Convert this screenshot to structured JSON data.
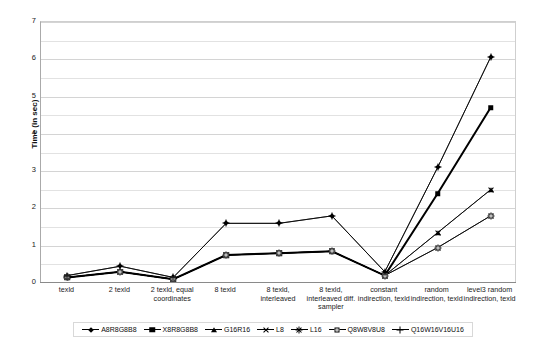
{
  "chart_data": {
    "type": "line",
    "title": "",
    "xlabel": "",
    "ylabel": "Time (in sec)",
    "ylim": [
      0,
      7
    ],
    "yticks": [
      0,
      1,
      2,
      3,
      4,
      5,
      6,
      7
    ],
    "ytick_labels": [
      "0",
      "1",
      "2",
      "3",
      "4",
      "5",
      "6",
      "7"
    ],
    "minor_gridlines": [
      0.5,
      1.5,
      2.5,
      3.5,
      4.5,
      5.5,
      6.5
    ],
    "grid": true,
    "legend_position": "bottom",
    "categories": [
      "texld",
      "2 texld",
      "2 texld, equal coordinates",
      "8 texld",
      "8 texld, interleaved",
      "8 texld, interleaved diff. sampler",
      "constant indirection, texld",
      "random indirection, texld",
      "level3 random indirection, texld"
    ],
    "series": [
      {
        "name": "A8R8G8B8",
        "marker": "diamond",
        "weight": "thin",
        "values": [
          0.2,
          0.45,
          0.15,
          1.6,
          1.6,
          1.8,
          0.3,
          3.1,
          6.05
        ]
      },
      {
        "name": "X8R8G8B8",
        "marker": "square",
        "weight": "thick",
        "values": [
          0.15,
          0.3,
          0.1,
          0.75,
          0.8,
          0.85,
          0.2,
          2.4,
          4.7
        ]
      },
      {
        "name": "G16R16",
        "marker": "triangle",
        "weight": "thin",
        "values": [
          0.15,
          0.3,
          0.1,
          0.75,
          0.8,
          0.85,
          0.2,
          1.35,
          2.5
        ]
      },
      {
        "name": "L8",
        "marker": "x",
        "weight": "thin",
        "values": [
          0.15,
          0.3,
          0.1,
          0.75,
          0.8,
          0.85,
          0.2,
          1.35,
          2.5
        ]
      },
      {
        "name": "L16",
        "marker": "star",
        "weight": "thin",
        "values": [
          0.15,
          0.3,
          0.1,
          0.75,
          0.8,
          0.85,
          0.2,
          0.95,
          1.8
        ]
      },
      {
        "name": "Q8W8V8U8",
        "marker": "openbox",
        "weight": "thin",
        "values": [
          0.15,
          0.3,
          0.1,
          0.75,
          0.8,
          0.85,
          0.2,
          0.95,
          1.8
        ]
      },
      {
        "name": "Q16W16V16U16",
        "marker": "plus",
        "weight": "thin",
        "values": [
          0.2,
          0.45,
          0.15,
          1.6,
          1.6,
          1.8,
          0.3,
          3.1,
          6.05
        ]
      }
    ],
    "colors": {
      "series_line": "#000000",
      "gridline": "#e2e2e2",
      "axis": "#8a8a8a",
      "background": "#ffffff",
      "text": "#1a1a1a"
    }
  }
}
